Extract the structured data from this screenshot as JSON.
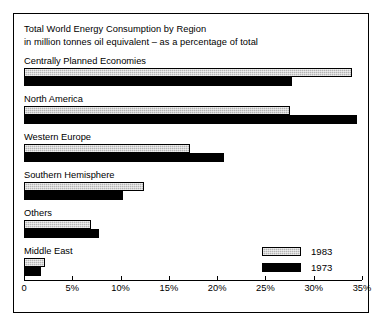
{
  "chart_data": {
    "type": "bar",
    "orientation": "horizontal",
    "title": "Total World Energy Consumption by Region",
    "subtitle": "in million tonnes oil equivalent – as a percentage of total",
    "xlabel": "",
    "ylabel": "",
    "xlim": [
      0,
      35
    ],
    "xunit": "%",
    "grid": false,
    "legend_position": "bottom-right",
    "tick_values": [
      0,
      5,
      10,
      15,
      20,
      25,
      30,
      35
    ],
    "tick_labels": [
      "0",
      "5%",
      "10%",
      "15%",
      "20%",
      "25%",
      "30%",
      "35%"
    ],
    "categories": [
      "Centrally Planned Economies",
      "North America",
      "Western Europe",
      "Southern Hemisphere",
      "Others",
      "Middle East"
    ],
    "series": [
      {
        "name": "1983",
        "color": "#b4b4b4",
        "values": [
          34.0,
          27.5,
          17.2,
          12.4,
          6.9,
          2.2
        ]
      },
      {
        "name": "1973",
        "color": "#000000",
        "values": [
          27.8,
          34.5,
          20.7,
          10.3,
          7.8,
          1.8
        ]
      }
    ]
  },
  "legend": {
    "entries": [
      {
        "label": "1983"
      },
      {
        "label": "1973"
      }
    ]
  }
}
